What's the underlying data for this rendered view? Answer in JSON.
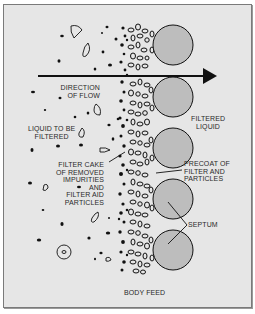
{
  "diagram": {
    "colors": {
      "background": "#e6e6e6",
      "border": "#7a7a7a",
      "septum_fill": "#bdbdbd",
      "ink": "#111111",
      "text": "#2a2a2a"
    },
    "labels": {
      "direction_of_flow": [
        "DIRECTION",
        "OF FLOW"
      ],
      "liquid_to_be_filtered": [
        "LIQUID TO BE",
        "FILTERED"
      ],
      "filtered_liquid": [
        "FILTERED",
        "LIQUID"
      ],
      "filter_cake": [
        "FILTER CAKE",
        "OF REMOVED",
        "IMPURITIES",
        "AND",
        "FILTER AID",
        "PARTICLES"
      ],
      "precoat": [
        "PRECOAT OF",
        "FILTER AND",
        "PARTICLES"
      ],
      "septum": "SEPTUM",
      "body_feed": "BODY FEED"
    },
    "flow_arrow": {
      "direction": "left-to-right",
      "icon": "arrow-right-icon"
    },
    "septum_circles": 5
  }
}
